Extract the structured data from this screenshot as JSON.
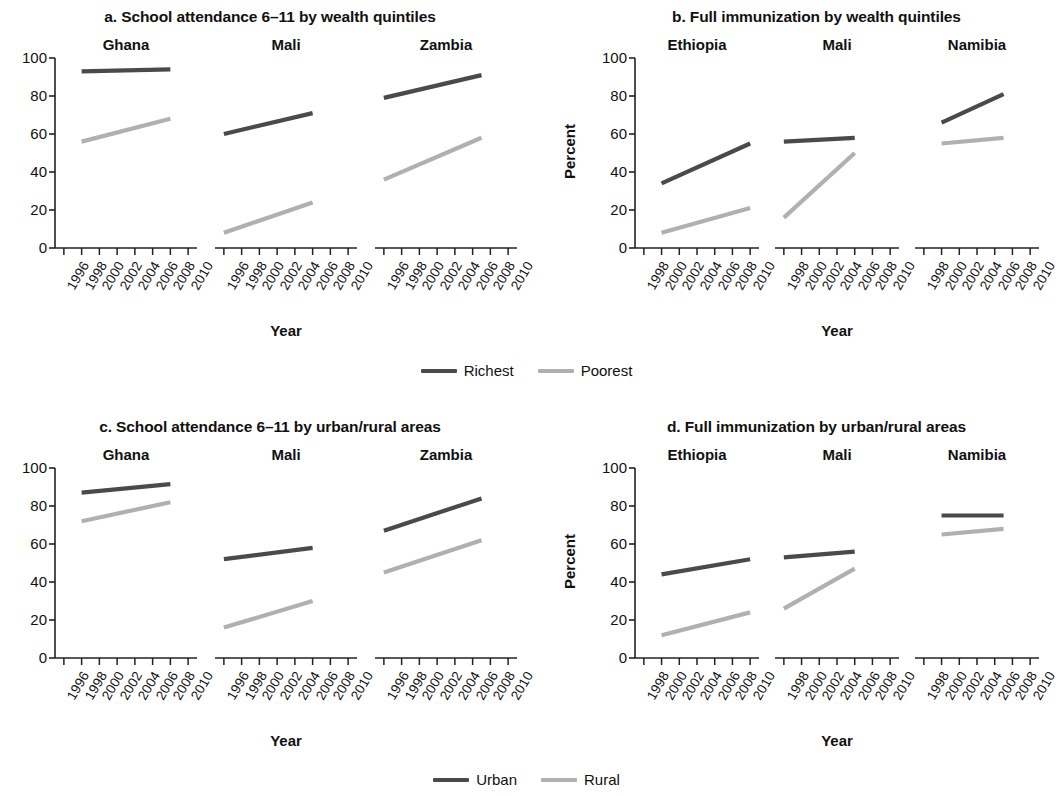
{
  "figure": {
    "yaxis_label": "Percent",
    "xaxis_label": "Year",
    "ylim": [
      0,
      100
    ],
    "yticks": [
      0,
      20,
      40,
      60,
      80,
      100
    ],
    "colors": {
      "dark": "#4a4a4a",
      "light": "#b0b0b0",
      "axis": "#222222",
      "text": "#111111"
    }
  },
  "legends": {
    "wealth": {
      "dark_label": "Richest",
      "light_label": "Poorest"
    },
    "area": {
      "dark_label": "Urban",
      "light_label": "Rural"
    }
  },
  "chart_data": [
    {
      "id": "a",
      "type": "line",
      "title": "a. School attendance 6–11 by wealth quintiles",
      "xlabel": "Year",
      "ylabel": "Percent",
      "ylim": [
        0,
        100
      ],
      "yticks": [
        0,
        20,
        40,
        60,
        80,
        100
      ],
      "xticks": [
        1996,
        1998,
        2000,
        2002,
        2004,
        2006,
        2008,
        2010
      ],
      "xlim": [
        1995,
        2011
      ],
      "grid": false,
      "legend_position": "bottom-center",
      "panels": [
        {
          "name": "Ghana",
          "series": [
            {
              "name": "Richest",
              "x": [
                1998,
                2008
              ],
              "values": [
                93,
                94
              ]
            },
            {
              "name": "Poorest",
              "x": [
                1998,
                2008
              ],
              "values": [
                56,
                68
              ]
            }
          ]
        },
        {
          "name": "Mali",
          "series": [
            {
              "name": "Richest",
              "x": [
                1996,
                2006
              ],
              "values": [
                60,
                71
              ]
            },
            {
              "name": "Poorest",
              "x": [
                1996,
                2006
              ],
              "values": [
                8,
                24
              ]
            }
          ]
        },
        {
          "name": "Zambia",
          "series": [
            {
              "name": "Richest",
              "x": [
                1996,
                2007
              ],
              "values": [
                79,
                91
              ]
            },
            {
              "name": "Poorest",
              "x": [
                1996,
                2007
              ],
              "values": [
                36,
                58
              ]
            }
          ]
        }
      ]
    },
    {
      "id": "b",
      "type": "line",
      "title": "b. Full immunization by wealth quintiles",
      "xlabel": "Year",
      "ylabel": "Percent",
      "ylim": [
        0,
        100
      ],
      "yticks": [
        0,
        20,
        40,
        60,
        80,
        100
      ],
      "xticks": [
        1998,
        2000,
        2002,
        2004,
        2006,
        2008,
        2010
      ],
      "xlim": [
        1997,
        2011
      ],
      "grid": false,
      "legend_position": "bottom-center",
      "panels": [
        {
          "name": "Ethiopia",
          "series": [
            {
              "name": "Richest",
              "x": [
                2000,
                2010
              ],
              "values": [
                34,
                55
              ]
            },
            {
              "name": "Poorest",
              "x": [
                2000,
                2010
              ],
              "values": [
                8,
                21
              ]
            }
          ]
        },
        {
          "name": "Mali",
          "series": [
            {
              "name": "Richest",
              "x": [
                1998,
                2006
              ],
              "values": [
                56,
                58
              ]
            },
            {
              "name": "Poorest",
              "x": [
                1998,
                2006
              ],
              "values": [
                16,
                50
              ]
            }
          ]
        },
        {
          "name": "Namibia",
          "series": [
            {
              "name": "Richest",
              "x": [
                2000,
                2007
              ],
              "values": [
                66,
                81
              ]
            },
            {
              "name": "Poorest",
              "x": [
                2000,
                2007
              ],
              "values": [
                55,
                58
              ]
            }
          ]
        }
      ]
    },
    {
      "id": "c",
      "type": "line",
      "title": "c. School attendance 6–11 by urban/rural areas",
      "xlabel": "Year",
      "ylabel": "Percent",
      "ylim": [
        0,
        100
      ],
      "yticks": [
        0,
        20,
        40,
        60,
        80,
        100
      ],
      "xticks": [
        1996,
        1998,
        2000,
        2002,
        2004,
        2006,
        2008,
        2010
      ],
      "xlim": [
        1995,
        2011
      ],
      "grid": false,
      "legend_position": "bottom-center",
      "panels": [
        {
          "name": "Ghana",
          "series": [
            {
              "name": "Urban",
              "x": [
                1998,
                2008
              ],
              "values": [
                87,
                91.5
              ]
            },
            {
              "name": "Rural",
              "x": [
                1998,
                2008
              ],
              "values": [
                72,
                82
              ]
            }
          ]
        },
        {
          "name": "Mali",
          "series": [
            {
              "name": "Urban",
              "x": [
                1996,
                2006
              ],
              "values": [
                52,
                58
              ]
            },
            {
              "name": "Rural",
              "x": [
                1996,
                2006
              ],
              "values": [
                16,
                30
              ]
            }
          ]
        },
        {
          "name": "Zambia",
          "series": [
            {
              "name": "Urban",
              "x": [
                1996,
                2007
              ],
              "values": [
                67,
                84
              ]
            },
            {
              "name": "Rural",
              "x": [
                1996,
                2007
              ],
              "values": [
                45,
                62
              ]
            }
          ]
        }
      ]
    },
    {
      "id": "d",
      "type": "line",
      "title": "d. Full immunization by urban/rural areas",
      "xlabel": "Year",
      "ylabel": "Percent",
      "ylim": [
        0,
        100
      ],
      "yticks": [
        0,
        20,
        40,
        60,
        80,
        100
      ],
      "xticks": [
        1998,
        2000,
        2002,
        2004,
        2006,
        2008,
        2010
      ],
      "xlim": [
        1997,
        2011
      ],
      "grid": false,
      "legend_position": "bottom-center",
      "panels": [
        {
          "name": "Ethiopia",
          "series": [
            {
              "name": "Urban",
              "x": [
                2000,
                2010
              ],
              "values": [
                44,
                52
              ]
            },
            {
              "name": "Rural",
              "x": [
                2000,
                2010
              ],
              "values": [
                12,
                24
              ]
            }
          ]
        },
        {
          "name": "Mali",
          "series": [
            {
              "name": "Urban",
              "x": [
                1998,
                2006
              ],
              "values": [
                53,
                56
              ]
            },
            {
              "name": "Rural",
              "x": [
                1998,
                2006
              ],
              "values": [
                26,
                47
              ]
            }
          ]
        },
        {
          "name": "Namibia",
          "series": [
            {
              "name": "Urban",
              "x": [
                2000,
                2007
              ],
              "values": [
                75,
                75
              ]
            },
            {
              "name": "Rural",
              "x": [
                2000,
                2007
              ],
              "values": [
                65,
                68
              ]
            }
          ]
        }
      ]
    }
  ]
}
